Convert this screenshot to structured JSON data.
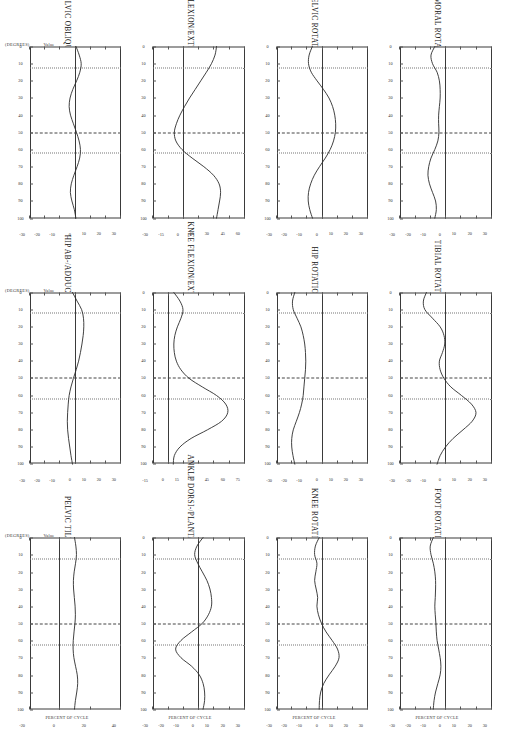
{
  "report": {
    "orientation_deg": 90,
    "columns": 3,
    "rows": 4,
    "axis_caption": "PERCENT OF CYCLE",
    "unit_caption_left": "(DEGREES)",
    "unit_caption_right": "Value",
    "line_color": "#2b2b2b",
    "frame_color": "#3a3a3a",
    "gridline_color": "#777777",
    "event_dot_label": "dotted-event-line",
    "event_dashdot_label": "dash-dot-event-line"
  },
  "chart_data": [
    {
      "type": "line",
      "title": "PELVIC TILT",
      "xlabel": "PERCENT OF CYCLE",
      "ylabel": "(DEGREES)",
      "xlim": [
        0,
        100
      ],
      "ylim": [
        -20,
        40
      ],
      "xticks": [
        0,
        10,
        20,
        30,
        40,
        50,
        60,
        70,
        80,
        90,
        100
      ],
      "yticks": [
        -20,
        0,
        20,
        40
      ],
      "grid": true,
      "events": [
        12,
        50,
        62
      ],
      "x": [
        0,
        5,
        10,
        15,
        20,
        25,
        30,
        35,
        40,
        45,
        50,
        55,
        60,
        65,
        70,
        75,
        80,
        85,
        90,
        95,
        100
      ],
      "values": [
        9.5,
        10.4,
        10.8,
        10.2,
        9.3,
        8.8,
        8.9,
        9.4,
        9.9,
        10.1,
        9.8,
        9.2,
        8.7,
        8.6,
        9.1,
        10.2,
        11.3,
        11.6,
        11.0,
        10.1,
        9.5
      ]
    },
    {
      "type": "line",
      "title": "PELVIC OBLIQUITY",
      "xlabel": "PERCENT OF CYCLE",
      "ylabel": "(DEGREES)",
      "xlim": [
        0,
        100
      ],
      "ylim": [
        -30,
        30
      ],
      "xticks": [
        0,
        10,
        20,
        30,
        40,
        50,
        60,
        70,
        80,
        90,
        100
      ],
      "yticks": [
        -30,
        -20,
        -10,
        0,
        10,
        20,
        30
      ],
      "grid": true,
      "events": [
        12,
        50,
        62
      ],
      "x": [
        0,
        5,
        10,
        15,
        20,
        25,
        30,
        35,
        40,
        45,
        50,
        55,
        60,
        65,
        70,
        75,
        80,
        85,
        90,
        95,
        100
      ],
      "values": [
        0.5,
        2.6,
        3.9,
        3.0,
        0.9,
        -1.6,
        -3.4,
        -4.0,
        -3.1,
        -1.2,
        0.8,
        2.5,
        3.4,
        2.9,
        1.2,
        -0.9,
        -2.6,
        -3.2,
        -2.2,
        -0.6,
        0.4
      ]
    },
    {
      "type": "line",
      "title": "PELVIC ROTATION",
      "xlabel": "PERCENT OF CYCLE",
      "ylabel": "(DEGREES)",
      "xlim": [
        0,
        100
      ],
      "ylim": [
        -30,
        30
      ],
      "xticks": [
        0,
        10,
        20,
        30,
        40,
        50,
        60,
        70,
        80,
        90,
        100
      ],
      "yticks": [
        -30,
        -20,
        -10,
        0,
        10,
        20,
        30
      ],
      "grid": true,
      "events": [
        12,
        50,
        62
      ],
      "x": [
        0,
        5,
        10,
        15,
        20,
        25,
        30,
        35,
        40,
        45,
        50,
        55,
        60,
        65,
        70,
        75,
        80,
        85,
        90,
        95,
        100
      ],
      "values": [
        -6.5,
        -8.6,
        -9.0,
        -7.2,
        -3.4,
        0.8,
        4.4,
        6.8,
        8.2,
        8.8,
        8.6,
        7.4,
        5.2,
        2.0,
        -1.8,
        -5.2,
        -7.6,
        -9.0,
        -9.2,
        -8.2,
        -6.4
      ]
    },
    {
      "type": "line",
      "title": "HIP AB-/ADDUCTION",
      "xlabel": "PERCENT OF CYCLE",
      "ylabel": "(DEGREES)",
      "xlim": [
        0,
        100
      ],
      "ylim": [
        -30,
        30
      ],
      "xticks": [
        0,
        10,
        20,
        30,
        40,
        50,
        60,
        70,
        80,
        90,
        100
      ],
      "yticks": [
        -30,
        -20,
        -10,
        0,
        10,
        20,
        30
      ],
      "grid": true,
      "events": [
        12,
        50,
        62
      ],
      "x": [
        0,
        5,
        10,
        15,
        20,
        25,
        30,
        35,
        40,
        45,
        50,
        55,
        60,
        65,
        70,
        75,
        80,
        85,
        90,
        95,
        100
      ],
      "values": [
        -1.8,
        1.2,
        4.2,
        5.4,
        5.6,
        5.2,
        4.4,
        3.4,
        2.2,
        0.6,
        -1.2,
        -2.8,
        -4.0,
        -4.6,
        -5.0,
        -5.2,
        -5.0,
        -4.4,
        -3.6,
        -2.8,
        -1.8
      ]
    },
    {
      "type": "line",
      "title": "HIP FLEXION/EXTENSION",
      "xlabel": "PERCENT OF CYCLE",
      "ylabel": "(DEGREES)",
      "xlim": [
        0,
        100
      ],
      "ylim": [
        -30,
        60
      ],
      "xticks": [
        0,
        10,
        20,
        30,
        40,
        50,
        60,
        70,
        80,
        90,
        100
      ],
      "yticks": [
        -30,
        -15,
        0,
        15,
        30,
        45,
        60
      ],
      "grid": true,
      "events": [
        12,
        50,
        62
      ],
      "x": [
        0,
        5,
        10,
        15,
        20,
        25,
        30,
        35,
        40,
        45,
        50,
        55,
        60,
        65,
        70,
        75,
        80,
        85,
        90,
        95,
        100
      ],
      "values": [
        32.0,
        30.5,
        27.0,
        22.0,
        16.5,
        11.0,
        5.5,
        0.5,
        -4.0,
        -7.5,
        -9.5,
        -8.0,
        -2.0,
        8.0,
        19.5,
        29.0,
        34.5,
        36.0,
        35.0,
        33.5,
        32.0
      ]
    },
    {
      "type": "line",
      "title": "HIP ROTATION",
      "xlabel": "PERCENT OF CYCLE",
      "ylabel": "(DEGREES)",
      "xlim": [
        0,
        100
      ],
      "ylim": [
        -30,
        30
      ],
      "xticks": [
        0,
        10,
        20,
        30,
        40,
        50,
        60,
        70,
        80,
        90,
        100
      ],
      "yticks": [
        -30,
        -20,
        -10,
        0,
        10,
        20,
        30
      ],
      "grid": true,
      "events": [
        12,
        50,
        62
      ],
      "x": [
        0,
        5,
        10,
        15,
        20,
        25,
        30,
        35,
        40,
        45,
        50,
        55,
        60,
        65,
        70,
        75,
        80,
        85,
        90,
        95,
        100
      ],
      "values": [
        -18.0,
        -19.5,
        -19.0,
        -16.5,
        -14.0,
        -12.5,
        -11.5,
        -11.0,
        -10.8,
        -11.0,
        -11.5,
        -12.0,
        -12.5,
        -13.5,
        -15.0,
        -17.0,
        -19.0,
        -20.0,
        -20.0,
        -19.2,
        -18.0
      ]
    },
    {
      "type": "line",
      "title": "KNEE FLEXION/EXTENSION",
      "xlabel": "PERCENT OF CYCLE",
      "ylabel": "(DEGREES)",
      "xlim": [
        0,
        100
      ],
      "ylim": [
        -15,
        75
      ],
      "xticks": [
        0,
        10,
        20,
        30,
        40,
        50,
        60,
        70,
        80,
        90,
        100
      ],
      "yticks": [
        -15,
        0,
        15,
        30,
        45,
        60,
        75
      ],
      "grid": true,
      "events": [
        12,
        50,
        62
      ],
      "x": [
        0,
        5,
        10,
        15,
        20,
        25,
        30,
        35,
        40,
        45,
        50,
        55,
        60,
        65,
        70,
        75,
        80,
        85,
        90,
        95,
        100
      ],
      "values": [
        5.0,
        11.0,
        14.0,
        12.0,
        8.5,
        6.0,
        5.0,
        5.5,
        7.5,
        12.0,
        20.0,
        33.0,
        47.0,
        56.0,
        58.0,
        52.0,
        38.0,
        22.0,
        11.0,
        5.5,
        4.5
      ]
    },
    {
      "type": "line",
      "title": "KNEE ROTATION",
      "xlabel": "PERCENT OF CYCLE",
      "ylabel": "(DEGREES)",
      "xlim": [
        0,
        100
      ],
      "ylim": [
        -30,
        30
      ],
      "xticks": [
        0,
        10,
        20,
        30,
        40,
        50,
        60,
        70,
        80,
        90,
        100
      ],
      "yticks": [
        -30,
        -20,
        -10,
        0,
        10,
        20,
        30
      ],
      "grid": true,
      "events": [
        12,
        50,
        62
      ],
      "x": [
        0,
        5,
        10,
        15,
        20,
        25,
        30,
        35,
        40,
        45,
        50,
        55,
        60,
        65,
        70,
        75,
        80,
        85,
        90,
        95,
        100
      ],
      "values": [
        -2.0,
        -4.5,
        -5.0,
        -3.5,
        -4.2,
        -5.0,
        -4.0,
        -3.0,
        -3.5,
        -2.5,
        -0.5,
        2.5,
        6.5,
        10.0,
        11.0,
        8.5,
        4.5,
        1.0,
        -1.0,
        -1.8,
        -2.0
      ]
    },
    {
      "type": "line",
      "title": "ANKLE DORSI-/PLANTAR FLEXION",
      "xlabel": "PERCENT OF CYCLE",
      "ylabel": "(DEGREES)",
      "xlim": [
        0,
        100
      ],
      "ylim": [
        -30,
        30
      ],
      "xticks": [
        0,
        10,
        20,
        30,
        40,
        50,
        60,
        70,
        80,
        90,
        100
      ],
      "yticks": [
        -30,
        -20,
        -10,
        0,
        10,
        20,
        30
      ],
      "grid": true,
      "events": [
        12,
        50,
        62
      ],
      "x": [
        0,
        5,
        10,
        15,
        20,
        25,
        30,
        35,
        40,
        45,
        50,
        55,
        60,
        65,
        70,
        75,
        80,
        85,
        90,
        95,
        100
      ],
      "values": [
        2.5,
        -1.5,
        -3.0,
        -1.0,
        2.0,
        5.0,
        7.0,
        8.0,
        8.0,
        6.0,
        2.0,
        -5.0,
        -12.0,
        -15.5,
        -12.0,
        -5.0,
        0.0,
        2.5,
        3.5,
        3.5,
        2.5
      ]
    },
    {
      "type": "line",
      "title": "FEMORAL ROTATION",
      "xlabel": "PERCENT OF CYCLE",
      "ylabel": "(DEGREES)",
      "xlim": [
        0,
        100
      ],
      "ylim": [
        -30,
        30
      ],
      "xticks": [
        0,
        10,
        20,
        30,
        40,
        50,
        60,
        70,
        80,
        90,
        100
      ],
      "yticks": [
        -30,
        -20,
        -10,
        0,
        10,
        20,
        30
      ],
      "grid": true,
      "events": [
        12,
        50,
        62
      ],
      "x": [
        0,
        5,
        10,
        15,
        20,
        25,
        30,
        35,
        40,
        45,
        50,
        55,
        60,
        65,
        70,
        75,
        80,
        85,
        90,
        95,
        100
      ],
      "values": [
        -7.5,
        -10.0,
        -9.0,
        -6.0,
        -4.5,
        -4.0,
        -4.0,
        -4.5,
        -5.0,
        -5.0,
        -4.8,
        -5.5,
        -7.5,
        -10.0,
        -11.5,
        -12.0,
        -11.0,
        -9.0,
        -7.0,
        -6.5,
        -7.5
      ]
    },
    {
      "type": "line",
      "title": "TIBIAL ROTATION",
      "xlabel": "PERCENT OF CYCLE",
      "ylabel": "(DEGREES)",
      "xlim": [
        0,
        100
      ],
      "ylim": [
        -30,
        30
      ],
      "xticks": [
        0,
        10,
        20,
        30,
        40,
        50,
        60,
        70,
        80,
        90,
        100
      ],
      "yticks": [
        -30,
        -20,
        -10,
        0,
        10,
        20,
        30
      ],
      "grid": true,
      "events": [
        12,
        50,
        62
      ],
      "x": [
        0,
        5,
        10,
        15,
        20,
        25,
        30,
        35,
        40,
        45,
        50,
        55,
        60,
        65,
        70,
        75,
        80,
        85,
        90,
        95,
        100
      ],
      "values": [
        -13.0,
        -15.0,
        -14.0,
        -9.0,
        -4.0,
        -1.5,
        -1.0,
        -2.5,
        -4.5,
        -4.0,
        -1.5,
        3.0,
        10.0,
        16.5,
        19.5,
        17.0,
        11.0,
        4.5,
        -0.5,
        -4.0,
        -6.0
      ]
    },
    {
      "type": "line",
      "title": "FOOT ROTATION",
      "xlabel": "PERCENT OF CYCLE",
      "ylabel": "(DEGREES)",
      "xlim": [
        0,
        100
      ],
      "ylim": [
        -30,
        30
      ],
      "xticks": [
        0,
        10,
        20,
        30,
        40,
        50,
        60,
        70,
        80,
        90,
        100
      ],
      "yticks": [
        -30,
        -20,
        -10,
        0,
        10,
        20,
        30
      ],
      "grid": true,
      "events": [
        12,
        50,
        62
      ],
      "x": [
        0,
        5,
        10,
        15,
        20,
        25,
        30,
        35,
        40,
        45,
        50,
        55,
        60,
        65,
        70,
        75,
        80,
        85,
        90,
        95,
        100
      ],
      "values": [
        -8.5,
        -10.5,
        -10.0,
        -8.5,
        -7.5,
        -7.0,
        -7.0,
        -7.2,
        -7.5,
        -7.2,
        -6.8,
        -6.5,
        -6.0,
        -5.0,
        -4.0,
        -3.5,
        -4.0,
        -5.5,
        -7.0,
        -8.0,
        -8.5
      ]
    }
  ],
  "layout_order": [
    "FEMORAL ROTATION",
    "TIBIAL ROTATION",
    "FOOT ROTATION",
    "PELVIC ROTATION",
    "HIP ROTATION",
    "KNEE ROTATION",
    "HIP FLEXION/EXTENSION",
    "KNEE FLEXION/EXTENSION",
    "ANKLE DORSI-/PLANTAR FLEXION",
    "PELVIC OBLIQUITY",
    "HIP AB-/ADDUCTION",
    "PELVIC TILT"
  ]
}
